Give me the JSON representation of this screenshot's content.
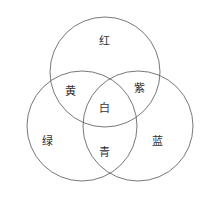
{
  "diagram": {
    "type": "venn",
    "stroke_color": "#555555",
    "circles": [
      {
        "name": "top",
        "cx": 105,
        "cy": 72,
        "r": 55
      },
      {
        "name": "left",
        "cx": 82,
        "cy": 126,
        "r": 55
      },
      {
        "name": "right",
        "cx": 138,
        "cy": 126,
        "r": 55
      }
    ],
    "regions": {
      "red": {
        "label": "红",
        "x": 104,
        "y": 42
      },
      "yellow": {
        "label": "黄",
        "x": 70,
        "y": 92
      },
      "purple": {
        "label": "紫",
        "x": 139,
        "y": 89
      },
      "white": {
        "label": "白",
        "x": 104,
        "y": 109
      },
      "green": {
        "label": "绿",
        "x": 47,
        "y": 142
      },
      "cyan": {
        "label": "青",
        "x": 104,
        "y": 153
      },
      "blue": {
        "label": "蓝",
        "x": 157,
        "y": 142
      }
    }
  }
}
